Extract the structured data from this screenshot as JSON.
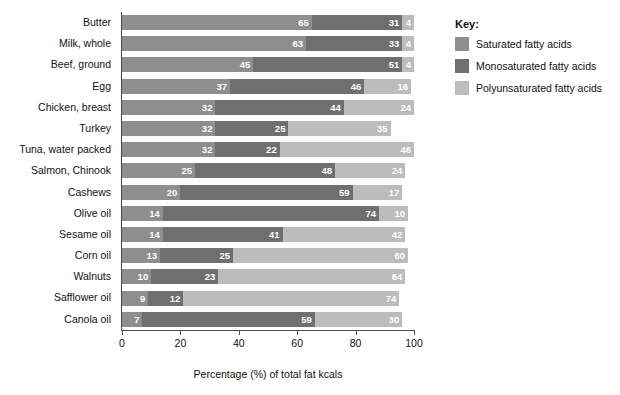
{
  "chart_data": {
    "type": "bar",
    "orientation": "horizontal",
    "stacked": true,
    "title": "",
    "xlabel": "Percentage (%) of total fat kcals",
    "ylabel": "",
    "xlim": [
      0,
      100
    ],
    "xticks": [
      0,
      20,
      40,
      60,
      80,
      100
    ],
    "grid": false,
    "legend_position": "right",
    "legend_title": "Key:",
    "categories": [
      "Butter",
      "Milk, whole",
      "Beef, ground",
      "Egg",
      "Chicken, breast",
      "Turkey",
      "Tuna, water packed",
      "Salmon, Chinook",
      "Cashews",
      "Olive oil",
      "Sesame oil",
      "Corn oil",
      "Walnuts",
      "Safflower oil",
      "Canola oil"
    ],
    "series": [
      {
        "name": "Saturated fatty acids",
        "color": "#8e8e8e",
        "values": [
          65,
          63,
          45,
          37,
          32,
          32,
          32,
          25,
          20,
          14,
          14,
          13,
          10,
          9,
          7
        ]
      },
      {
        "name": "Monosaturated fatty acids",
        "color": "#6f6f6f",
        "values": [
          31,
          33,
          51,
          46,
          44,
          25,
          22,
          48,
          59,
          74,
          41,
          25,
          23,
          12,
          59
        ]
      },
      {
        "name": "Polyunsaturated fatty acids",
        "color": "#bcbcbc",
        "values": [
          4,
          4,
          4,
          16,
          24,
          35,
          46,
          24,
          17,
          10,
          42,
          60,
          64,
          74,
          30
        ]
      }
    ]
  },
  "axis": {
    "tick_labels": [
      "0",
      "20",
      "40",
      "60",
      "80",
      "100"
    ],
    "x_title": "Percentage (%) of total fat kcals"
  },
  "legend": {
    "title": "Key:",
    "items": [
      {
        "label": "Saturated fatty acids",
        "color": "#8e8e8e"
      },
      {
        "label": "Monosaturated fatty acids",
        "color": "#6f6f6f"
      },
      {
        "label": "Polyunsaturated fatty acids",
        "color": "#bcbcbc"
      }
    ]
  }
}
